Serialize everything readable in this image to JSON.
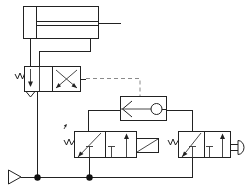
{
  "diagram": {
    "caption": "",
    "background_color": "#ffffff",
    "line_color": "#222222",
    "pilot_line_color": "#8a8a8a",
    "node_color": "#111111"
  },
  "components": [
    {
      "id": "cylinder",
      "data_name": "double-acting-cylinder",
      "label": "Double-acting cylinder",
      "type": "actuator",
      "x": 23,
      "y": 6,
      "width": 86,
      "height": 33
    },
    {
      "id": "valve_main",
      "data_name": "valve-4-2-directional-main",
      "label": "4/2 directional control valve, spring return, pilot operated",
      "type": "directional-valve",
      "positions": 2,
      "ports": 4,
      "actuator_left": "spring",
      "actuator_right": "pilot",
      "x": 24,
      "y": 66,
      "width": 56,
      "height": 26
    },
    {
      "id": "valve_shuttle",
      "data_name": "valve-shuttle-or",
      "label": "Shuttle valve (OR function)",
      "type": "shuttle-valve",
      "x": 120,
      "y": 96,
      "width": 46,
      "height": 24
    },
    {
      "id": "valve_left_32",
      "data_name": "valve-3-2-roller-lever",
      "label": "3/2 valve, roller lever actuated, spring return",
      "type": "directional-valve",
      "positions": 2,
      "ports": 3,
      "actuator_left": "spring",
      "actuator_right": "roller-lever",
      "x": 74,
      "y": 131,
      "width": 62,
      "height": 26
    },
    {
      "id": "valve_right_32",
      "data_name": "valve-3-2-push-button",
      "label": "3/2 valve, push button actuated, spring return",
      "type": "directional-valve",
      "positions": 2,
      "ports": 3,
      "actuator_left": "spring",
      "actuator_right": "push-button",
      "x": 178,
      "y": 131,
      "width": 52,
      "height": 26
    },
    {
      "id": "supply",
      "data_name": "air-supply-source",
      "label": "Compressed air supply",
      "type": "source",
      "x": 8,
      "y": 170
    }
  ],
  "junctions": [
    {
      "data_name": "junction-node-supply",
      "x": 37,
      "y": 177
    },
    {
      "data_name": "junction-node-left-valve",
      "x": 89,
      "y": 177
    }
  ],
  "annotations": {
    "roller_marker": {
      "data_name": "roller-lever-trip-marker",
      "x": 64,
      "y": 125
    }
  }
}
